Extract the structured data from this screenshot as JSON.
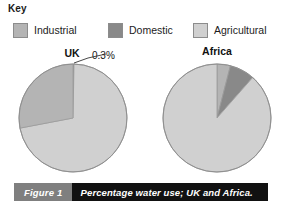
{
  "key": {
    "title": "Key",
    "items": [
      {
        "label": "Industrial",
        "color": "#b4b4b4",
        "swatch_name": "legend-swatch-industrial"
      },
      {
        "label": "Domestic",
        "color": "#898989",
        "swatch_name": "legend-swatch-domestic"
      },
      {
        "label": "Agricultural",
        "color": "#d0d0d0",
        "swatch_name": "legend-swatch-agricultural"
      }
    ]
  },
  "charts": {
    "uk": {
      "title": "UK",
      "callout": "0.3%"
    },
    "africa": {
      "title": "Africa"
    }
  },
  "caption": {
    "tag": "Figure 1",
    "text": "Percentage water use; UK and Africa.",
    "tag_background": "#7f7f7f",
    "bar_background": "#111111"
  },
  "chart_data": [
    {
      "type": "pie",
      "title": "UK",
      "categories": [
        "Domestic",
        "Agricultural",
        "Industrial"
      ],
      "values": [
        0.3,
        71.7,
        28.0
      ],
      "colors": [
        "#898989",
        "#d0d0d0",
        "#b4b4b4"
      ],
      "unit": "%",
      "annotations": [
        {
          "text": "0.3%",
          "target_category": "Domestic"
        }
      ],
      "start_angle_deg": 0,
      "direction": "clockwise",
      "legend_position": "top",
      "grid": false
    },
    {
      "type": "pie",
      "title": "Africa",
      "categories": [
        "Industrial",
        "Domestic",
        "Agricultural"
      ],
      "values": [
        4.0,
        7.5,
        88.5
      ],
      "colors": [
        "#b4b4b4",
        "#898989",
        "#d0d0d0"
      ],
      "unit": "%",
      "annotations": [],
      "start_angle_deg": 0,
      "direction": "clockwise",
      "legend_position": "top",
      "grid": false
    }
  ]
}
